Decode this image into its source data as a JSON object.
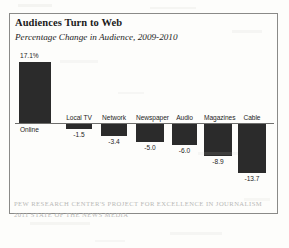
{
  "chart_data": {
    "type": "bar",
    "title": "Audiences Turn to Web",
    "subtitle": "Percentage Change in Audience, 2009-2010",
    "xlabel": "",
    "ylabel": "",
    "grid": false,
    "legend": "none",
    "ylim": [
      -15,
      18
    ],
    "categories": [
      "Online",
      "Local TV",
      "Network",
      "Newspaper",
      "Audio",
      "Magazines",
      "Cable"
    ],
    "values": [
      17.1,
      -1.5,
      -3.4,
      -5.0,
      -6.0,
      -8.9,
      -13.7
    ],
    "value_labels": [
      "17.1%",
      "-1.5",
      "-3.4",
      "-5.0",
      "-6.0",
      "-8.9",
      "-13.7"
    ],
    "bar_color": "#2b2b2b",
    "axis_color": "#6e6e6c"
  },
  "source": {
    "line1": "PEW RESEARCH CENTER'S PROJECT FOR EXCELLENCE IN JOURNALISM",
    "line2": "2011 STATE OF THE NEWS MEDIA"
  }
}
